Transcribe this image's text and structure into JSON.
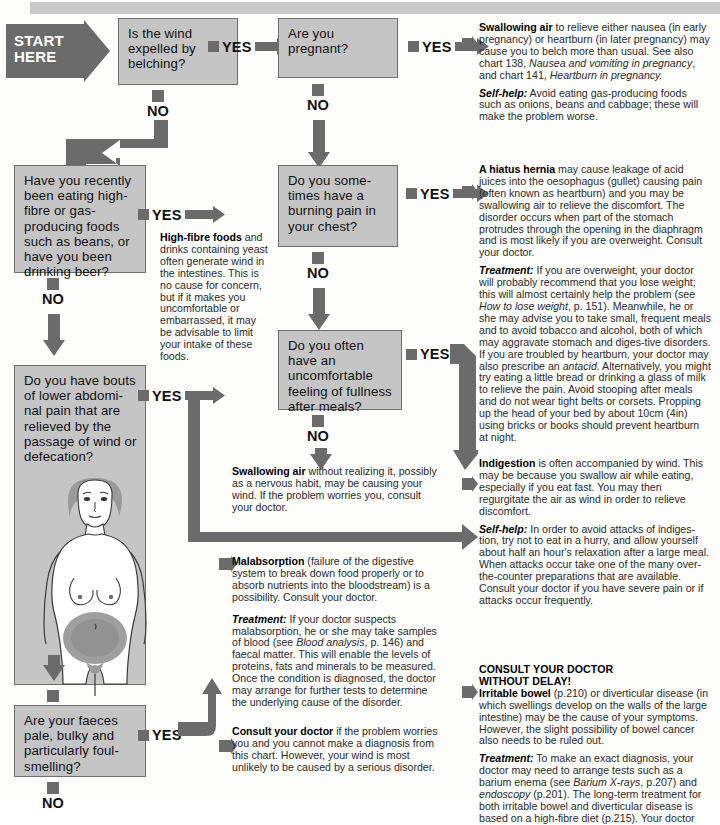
{
  "chart": {
    "start_label": "START\nHERE",
    "yes_label": "YES",
    "no_label": "NO"
  },
  "questions": [
    {
      "id": "q1",
      "text": "Is the wind expelled by belching?"
    },
    {
      "id": "q2",
      "text": "Are you pregnant?"
    },
    {
      "id": "q3",
      "text": "Have you recently been eating high-fibre or gas-producing foods such as beans, or have you been drinking beer?"
    },
    {
      "id": "q4",
      "text": "Do you some-times have a burning pain in your chest?"
    },
    {
      "id": "q5",
      "text": "Do you have bouts of lower abdomi-nal pain that are relieved by the passage of wind or defecation?"
    },
    {
      "id": "q6",
      "text": "Do you often have an uncomfortable feeling of fullness after meals?"
    },
    {
      "id": "q7",
      "text": "Are your faeces pale, bulky and particularly foul-smelling?"
    }
  ],
  "advice": {
    "swallowing_air_pregnancy": {
      "lead": "Swallowing air",
      "body1": " to relieve either nausea (in early pregnancy) or heartburn (in later pregnancy) may cause you to belch more than usual. See also chart 138, ",
      "ital1": "Nausea and vomiting in pregnancy",
      "body2": ", and chart 141, ",
      "ital2": "Heartburn in pregnancy.",
      "selfhelp_lead": "Self-help:",
      "selfhelp_body": " Avoid eating gas-producing foods such as onions, beans and cabbage; these will make the problem worse."
    },
    "high_fibre": {
      "lead": "High-fibre foods",
      "body": " and drinks containing yeast often generate wind in the intestines. This is no cause for concern, but if it makes you uncomfortable or embarrassed, it may be advisable to limit your intake of these foods."
    },
    "hiatus_hernia": {
      "lead": "A hiatus hernia",
      "body": " may cause leakage of acid juices into the oesophagus (gullet) causing pain (often known as heartburn) and you may be swallowing air to relieve the discomfort. The disorder occurs when part of the stomach protrudes through the opening in the diaphragm and is most likely if you are overweight. Consult your doctor.",
      "treatment_lead": "Treatment:",
      "treatment_body1": " If you are overweight, your doctor will probably recommend that you lose weight; this will almost certainly help the problem (see ",
      "treatment_ital1": "How to lose weight",
      "treatment_body2": ", p. 151). Meanwhile, he or she may advise you to take small, frequent meals and to avoid tobacco and alcohol, both of which may aggravate stomach and diges-tive disorders. If you are troubled by heartburn, your doctor may also prescribe an ",
      "treatment_ital2": "antacid",
      "treatment_body3": ". Alternatively, you might try eating a little bread or drinking a glass of milk to relieve the pain. Avoid stooping after meals and do not wear tight belts or corsets. Propping up the head of your bed by about 10cm (4in) using bricks or books should prevent heartburn at night."
    },
    "swallowing_air_habit": {
      "lead": "Swallowing air",
      "body": " without realizing it, possibly as a nervous habit, may be causing your wind. If the problem worries you, consult your doctor."
    },
    "indigestion": {
      "lead": "Indigestion",
      "body": " is often accompanied by wind. This may be because you swallow air while eating, especially if you eat fast. You may then regurgitate the air as wind in order to relieve discomfort.",
      "selfhelp_lead": "Self-help:",
      "selfhelp_body": " In order to avoid attacks of indiges-tion, try not to eat in a hurry, and allow yourself about half an hour's relaxation after a large meal. When attacks occur take one of the many over-the-counter preparations that are available. Consult your doctor if you have severe pain or if attacks occur frequently."
    },
    "malabsorption": {
      "lead": "Malabsorption",
      "body": " (failure of the digestive system to break down food properly or to absorb nutrients into the bloodstream) is a possibility. Consult your doctor.",
      "treatment_lead": "Treatment:",
      "treatment_body1": " If your doctor suspects malabsorption, he or she may take samples of blood (see ",
      "treatment_ital1": "Blood analysis",
      "treatment_body2": ", p. 146) and faecal matter. This will enable the levels of proteins, fats and minerals to be measured. Once the condition is diagnosed, the doctor may arrange for further tests to determine the underlying cause of the disorder."
    },
    "consult_doctor": {
      "lead": "Consult your doctor",
      "body": " if the problem worries you and you cannot make a diagnosis from this chart. However, your wind is most unlikely to be caused by a serious disorder."
    },
    "urgent": {
      "heading_line1": "CONSULT YOUR DOCTOR",
      "heading_line2": "WITHOUT DELAY!",
      "lead": "Irritable bowel",
      "body": " (p.210) or diverticular disease (in which swellings develop on the walls of the large intestine) may be the cause of your symptoms. However, the slight possibility of bowel cancer also needs to be ruled out.",
      "treatment_lead": "Treatment:",
      "treatment_body1": " To make an exact diagnosis, your doctor may need to arrange tests such as a barium enema (see ",
      "treatment_ital1": "Barium X-rays",
      "treatment_body2": ", p.207) and ",
      "treatment_ital2": "endoscopy",
      "treatment_body3": " (p.201). The long-term treatment for both irritable bowel and diverticular disease is based on a high-fibre diet (p.215). Your doctor"
    }
  },
  "figure": {
    "name": "female-torso-abdominal-pain",
    "caption": ""
  },
  "colors": {
    "box_fill": "#c5c5c5",
    "box_border": "#6e6e6e",
    "arrow": "#6b6b6b",
    "banner": "#c9c9c9",
    "text": "#1a1a1a"
  }
}
